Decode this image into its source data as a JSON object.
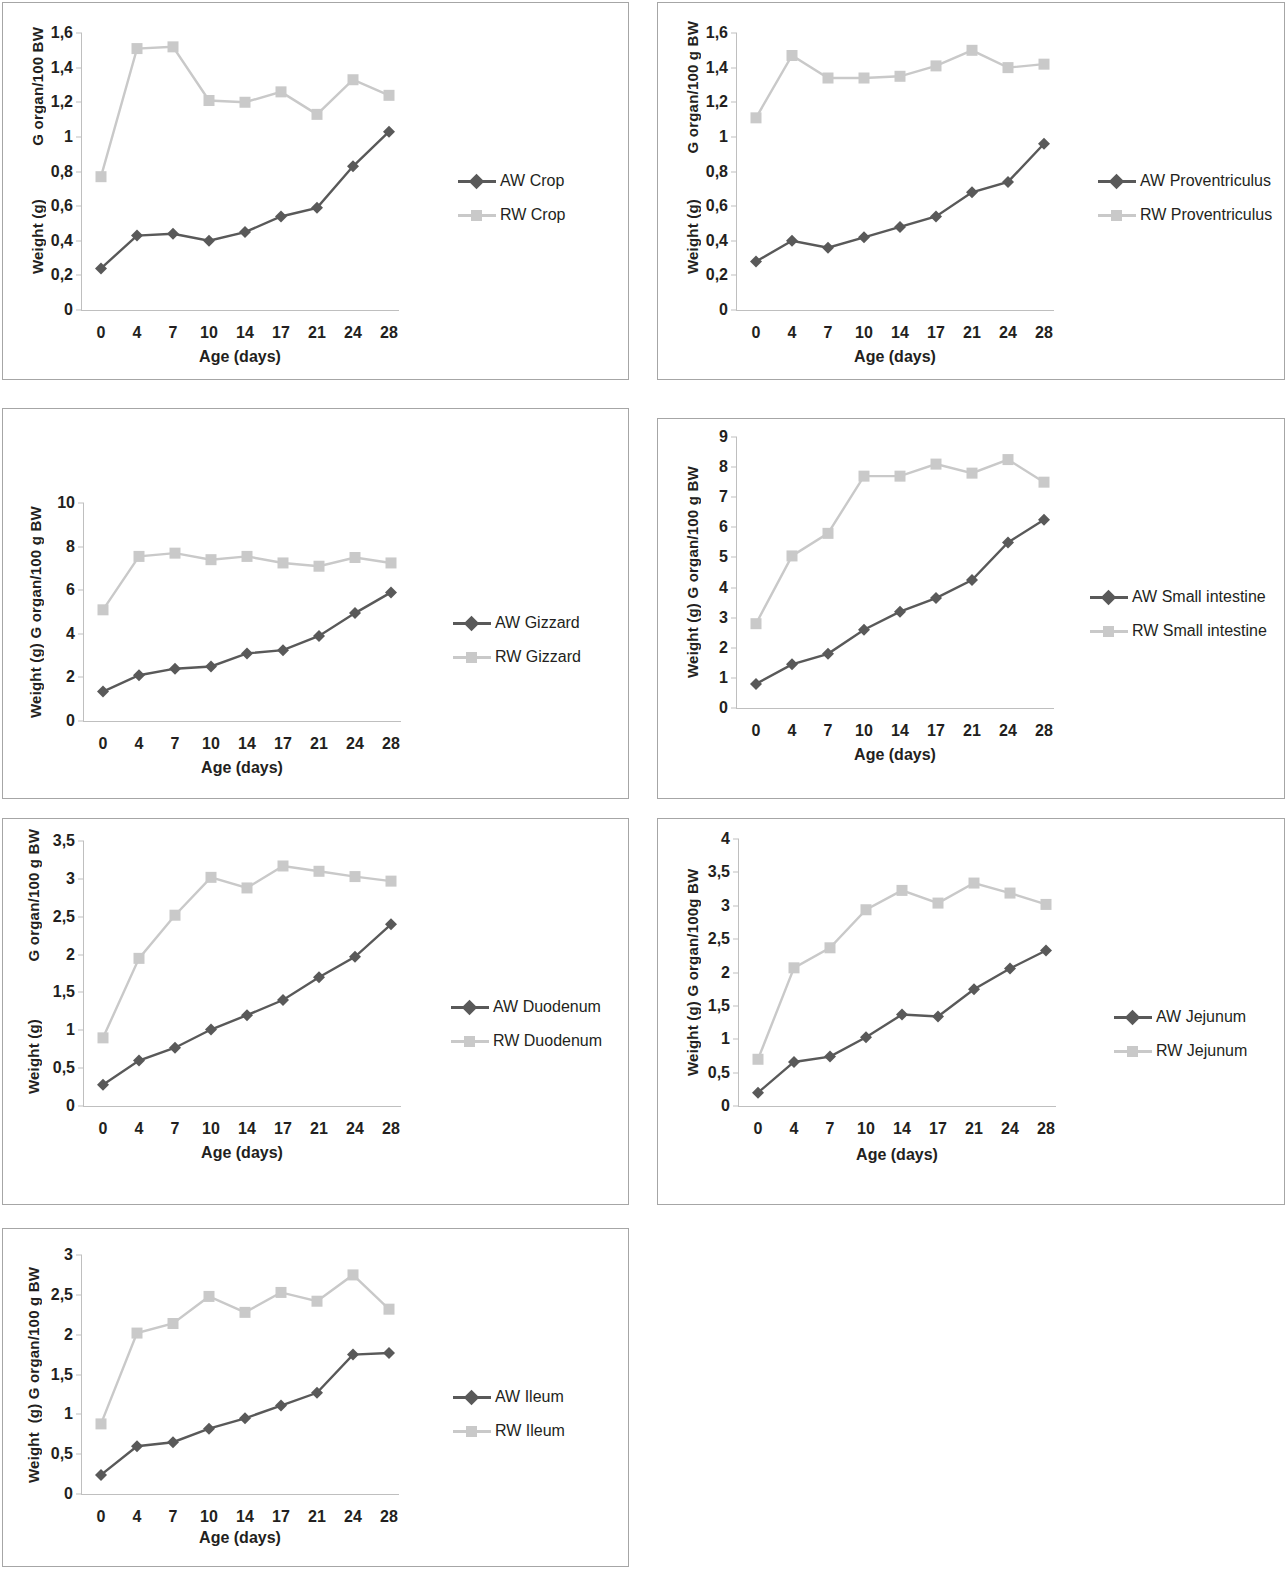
{
  "figure": {
    "xlabel": "Age (days)",
    "categories": [
      "0",
      "4",
      "7",
      "10",
      "14",
      "17",
      "21",
      "24",
      "28"
    ],
    "colors": {
      "aw": "#595959",
      "rw": "#c9c9c9",
      "axis": "#bfbfbf",
      "border": "#a6a6a6",
      "text": "#231f20"
    }
  },
  "chart_data": [
    {
      "id": "crop",
      "type": "line",
      "title": "",
      "ylabel_left": "Weight (g)",
      "ylabel_right": "G organ/100 BW",
      "xlabel": "Age (days)",
      "categories": [
        "0",
        "4",
        "7",
        "10",
        "14",
        "17",
        "21",
        "24",
        "28"
      ],
      "ylim": [
        0,
        1.6
      ],
      "yticks": [
        "0",
        "0,2",
        "0,4",
        "0,6",
        "0,8",
        "1",
        "1,2",
        "1,4",
        "1,6"
      ],
      "ytickvals": [
        0,
        0.2,
        0.4,
        0.6,
        0.8,
        1.0,
        1.2,
        1.4,
        1.6
      ],
      "grid": false,
      "legend_position": "right",
      "series": [
        {
          "name": "AW Crop",
          "style": "aw",
          "values": [
            0.24,
            0.43,
            0.44,
            0.4,
            0.45,
            0.54,
            0.59,
            0.83,
            1.03
          ]
        },
        {
          "name": "RW Crop",
          "style": "rw",
          "values": [
            0.77,
            1.51,
            1.52,
            1.21,
            1.2,
            1.26,
            1.13,
            1.33,
            1.24
          ]
        }
      ]
    },
    {
      "id": "proventriculus",
      "type": "line",
      "title": "",
      "ylabel_left": "Weight (g)",
      "ylabel_right": "G organ/100 g BW",
      "xlabel": "Age (days)",
      "categories": [
        "0",
        "4",
        "7",
        "10",
        "14",
        "17",
        "21",
        "24",
        "28"
      ],
      "ylim": [
        0,
        1.6
      ],
      "yticks": [
        "0",
        "0,2",
        "0,4",
        "0,6",
        "0,8",
        "1",
        "1,2",
        "1,4",
        "1,6"
      ],
      "ytickvals": [
        0,
        0.2,
        0.4,
        0.6,
        0.8,
        1.0,
        1.2,
        1.4,
        1.6
      ],
      "grid": false,
      "legend_position": "right",
      "series": [
        {
          "name": "AW Proventriculus",
          "style": "aw",
          "values": [
            0.28,
            0.4,
            0.36,
            0.42,
            0.48,
            0.54,
            0.68,
            0.74,
            0.96
          ]
        },
        {
          "name": "RW Proventriculus",
          "style": "rw",
          "values": [
            1.11,
            1.47,
            1.34,
            1.34,
            1.35,
            1.41,
            1.5,
            1.4,
            1.42
          ]
        }
      ]
    },
    {
      "id": "gizzard",
      "type": "line",
      "title": "",
      "ylabel_left": "Weight (g) G organ/100 g BW",
      "ylabel_right": "",
      "xlabel": "Age (days)",
      "categories": [
        "0",
        "4",
        "7",
        "10",
        "14",
        "17",
        "21",
        "24",
        "28"
      ],
      "ylim": [
        0,
        10
      ],
      "yticks": [
        "0",
        "2",
        "4",
        "6",
        "8",
        "10"
      ],
      "ytickvals": [
        0,
        2,
        4,
        6,
        8,
        10
      ],
      "grid": false,
      "legend_position": "right",
      "series": [
        {
          "name": "AW Gizzard",
          "style": "aw",
          "values": [
            1.35,
            2.1,
            2.4,
            2.5,
            3.1,
            3.25,
            3.9,
            4.95,
            5.9
          ]
        },
        {
          "name": "RW Gizzard",
          "style": "rw",
          "values": [
            5.1,
            7.55,
            7.7,
            7.4,
            7.55,
            7.25,
            7.1,
            7.5,
            7.25
          ]
        }
      ]
    },
    {
      "id": "small-intestine",
      "type": "line",
      "title": "",
      "ylabel_left": "Weight (g) G organ/100 g BW",
      "ylabel_right": "",
      "xlabel": "Age (days)",
      "categories": [
        "0",
        "4",
        "7",
        "10",
        "14",
        "17",
        "21",
        "24",
        "28"
      ],
      "ylim": [
        0,
        9
      ],
      "yticks": [
        "0",
        "1",
        "2",
        "3",
        "4",
        "5",
        "6",
        "7",
        "8",
        "9"
      ],
      "ytickvals": [
        0,
        1,
        2,
        3,
        4,
        5,
        6,
        7,
        8,
        9
      ],
      "grid": false,
      "legend_position": "right",
      "series": [
        {
          "name": "AW Small intestine",
          "style": "aw",
          "values": [
            0.8,
            1.45,
            1.8,
            2.6,
            3.2,
            3.65,
            4.25,
            5.5,
            6.25
          ]
        },
        {
          "name": "RW Small intestine",
          "style": "rw",
          "values": [
            2.8,
            5.05,
            5.8,
            7.7,
            7.7,
            8.1,
            7.8,
            8.25,
            7.5
          ]
        }
      ]
    },
    {
      "id": "duodenum",
      "type": "line",
      "title": "",
      "ylabel_left": "Weight (g)",
      "ylabel_right": "G organ/100 g BW",
      "xlabel": "Age (days)",
      "categories": [
        "0",
        "4",
        "7",
        "10",
        "14",
        "17",
        "21",
        "24",
        "28"
      ],
      "ylim": [
        0,
        3.5
      ],
      "yticks": [
        "0",
        "0,5",
        "1",
        "1,5",
        "2",
        "2,5",
        "3",
        "3,5"
      ],
      "ytickvals": [
        0,
        0.5,
        1.0,
        1.5,
        2.0,
        2.5,
        3.0,
        3.5
      ],
      "grid": false,
      "legend_position": "right",
      "series": [
        {
          "name": "AW Duodenum",
          "style": "aw",
          "values": [
            0.28,
            0.6,
            0.77,
            1.01,
            1.2,
            1.4,
            1.7,
            1.97,
            2.4
          ]
        },
        {
          "name": "RW Duodenum",
          "style": "rw",
          "values": [
            0.9,
            1.95,
            2.52,
            3.02,
            2.88,
            3.17,
            3.1,
            3.03,
            2.97
          ]
        }
      ]
    },
    {
      "id": "jejunum",
      "type": "line",
      "title": "",
      "ylabel_left": "Weight (g) G organ/100g BW",
      "ylabel_right": "",
      "xlabel": "Age (days)",
      "categories": [
        "0",
        "4",
        "7",
        "10",
        "14",
        "17",
        "21",
        "24",
        "28"
      ],
      "ylim": [
        0,
        4
      ],
      "yticks": [
        "0",
        "0,5",
        "1",
        "1,5",
        "2",
        "2,5",
        "3",
        "3,5",
        "4"
      ],
      "ytickvals": [
        0,
        0.5,
        1.0,
        1.5,
        2.0,
        2.5,
        3.0,
        3.5,
        4.0
      ],
      "grid": false,
      "legend_position": "right",
      "series": [
        {
          "name": "AW Jejunum",
          "style": "aw",
          "values": [
            0.2,
            0.66,
            0.74,
            1.03,
            1.37,
            1.34,
            1.75,
            2.06,
            2.33
          ]
        },
        {
          "name": "RW Jejunum",
          "style": "rw",
          "values": [
            0.7,
            2.07,
            2.37,
            2.94,
            3.23,
            3.04,
            3.34,
            3.19,
            3.02
          ]
        }
      ]
    },
    {
      "id": "ileum",
      "type": "line",
      "title": "",
      "ylabel_left": "Weight  (g) G organ/100 g BW",
      "ylabel_right": "",
      "xlabel": "Age (days)",
      "categories": [
        "0",
        "4",
        "7",
        "10",
        "14",
        "17",
        "21",
        "24",
        "28"
      ],
      "ylim": [
        0,
        3
      ],
      "yticks": [
        "0",
        "0,5",
        "1",
        "1,5",
        "2",
        "2,5",
        "3"
      ],
      "ytickvals": [
        0,
        0.5,
        1.0,
        1.5,
        2.0,
        2.5,
        3.0
      ],
      "grid": false,
      "legend_position": "right",
      "series": [
        {
          "name": "AW Ileum",
          "style": "aw",
          "values": [
            0.24,
            0.6,
            0.65,
            0.82,
            0.95,
            1.11,
            1.27,
            1.75,
            1.77
          ]
        },
        {
          "name": "RW Ileum",
          "style": "rw",
          "values": [
            0.88,
            2.02,
            2.14,
            2.48,
            2.28,
            2.53,
            2.42,
            2.75,
            2.32
          ]
        }
      ]
    }
  ]
}
